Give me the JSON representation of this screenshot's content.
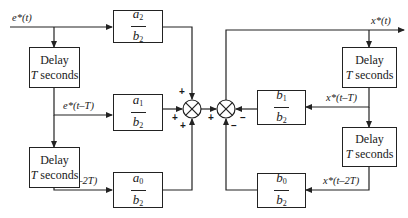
{
  "diagram": {
    "type": "block diagram",
    "signals": {
      "input": "e*(t)",
      "input_delay1": "e*(t–T)",
      "input_delay2": "e*(t–2T)",
      "output": "x*(t)",
      "output_delay1": "x*(t–T)",
      "output_delay2": "x*(t–2T)"
    },
    "delay_blocks": {
      "line1": "Delay",
      "line2_var": "T",
      "line2_rest": " seconds"
    },
    "gains": {
      "a2": {
        "num": "a",
        "num_sub": "2",
        "den": "b",
        "den_sub": "2"
      },
      "a1": {
        "num": "a",
        "num_sub": "1",
        "den": "b",
        "den_sub": "2"
      },
      "a0": {
        "num": "a",
        "num_sub": "0",
        "den": "b",
        "den_sub": "2"
      },
      "b1": {
        "num": "b",
        "num_sub": "1",
        "den": "b",
        "den_sub": "2"
      },
      "b0": {
        "num": "b",
        "num_sub": "0",
        "den": "b",
        "den_sub": "2"
      }
    },
    "summing_junctions": {
      "left": {
        "top": "+",
        "left": "+",
        "bottom": "+"
      },
      "right": {
        "left": "+",
        "right": "–",
        "bottom": "–"
      }
    }
  }
}
